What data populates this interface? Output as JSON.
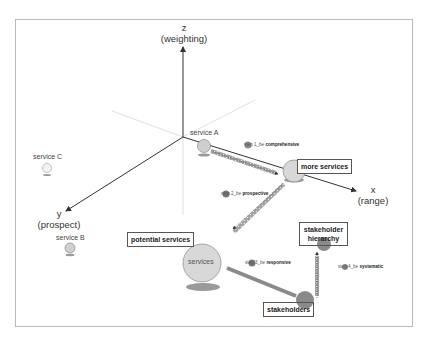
{
  "axes": {
    "z": {
      "letter": "z",
      "name": "(weighting)"
    },
    "x": {
      "letter": "x",
      "name": "(range)"
    },
    "y": {
      "letter": "y",
      "name": "(prospect)"
    }
  },
  "services": [
    {
      "label": "service A"
    },
    {
      "label": "service B"
    },
    {
      "label": "service C"
    }
  ],
  "boxes": {
    "more_services": "more services",
    "potential_services": "potential services",
    "stakeholder_hierarchy_1": "stakeholder",
    "stakeholder_hierarchy_2": "hierarchy",
    "stakeholders": "stakeholders"
  },
  "center_circle": {
    "label": "services"
  },
  "steps": [
    {
      "prefix": "step 1_be",
      "word": "comprehensive"
    },
    {
      "prefix": "step 2_be",
      "word": "prospective"
    },
    {
      "prefix": "step 3_be",
      "word": "responsive"
    },
    {
      "prefix": "step 4_be",
      "word": "systematic"
    }
  ],
  "colors": {
    "frame": "#bbbbbb",
    "axis": "#333333",
    "axis_faint": "#dddddd",
    "circle_light": "#d8d8d8",
    "circle_dark": "#8a8a8a",
    "shadow": "#999999",
    "arrow_band": "#9a9a9a"
  }
}
